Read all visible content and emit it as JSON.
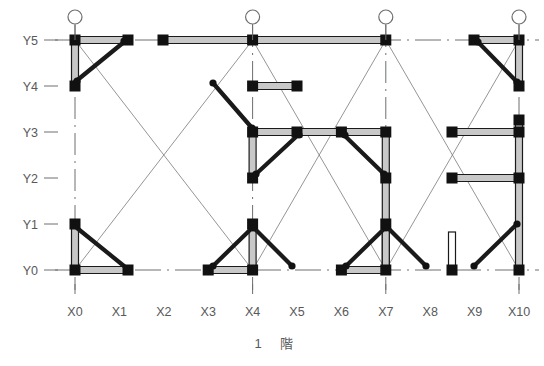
{
  "diagram": {
    "title": "1 階",
    "title_parts": {
      "floor_number": "1",
      "floor_unit": "階"
    },
    "type": "structural-floor-plan",
    "colors": {
      "background": "#ffffff",
      "axis_label": "#58595b",
      "grid_line": "#6d6e71",
      "thin_brace": "#7a7a7a",
      "member": "#1a1a1a",
      "beam_fill": "#c8c8c8",
      "node": "#111111"
    },
    "axes": {
      "x_label_name": "X",
      "y_label_name": "Y",
      "x_labels": [
        "X0",
        "X1",
        "X2",
        "X3",
        "X4",
        "X5",
        "X6",
        "X7",
        "X8",
        "X9",
        "X10"
      ],
      "y_labels": [
        "Y5",
        "Y4",
        "Y3",
        "Y2",
        "Y1",
        "Y0"
      ],
      "x_positions": [
        75,
        119.4,
        163.8,
        208.2,
        252.6,
        297,
        341.4,
        385.8,
        430.2,
        474.6,
        519
      ],
      "y_positions": {
        "Y5": 40,
        "Y4": 86,
        "Y3": 132,
        "Y2": 178,
        "Y1": 224,
        "Y0": 270
      },
      "x_tick_gridlines": [
        "X0",
        "X4",
        "X7",
        "X10"
      ],
      "y_tick_gridlines": [
        "Y5",
        "Y4",
        "Y3",
        "Y2",
        "Y1",
        "Y0"
      ]
    },
    "reference_circles": [
      {
        "name": "grid-circle-x0",
        "x": 75,
        "y": 17,
        "r": 7
      },
      {
        "name": "grid-circle-x4",
        "x": 252.6,
        "y": 17,
        "r": 7
      },
      {
        "name": "grid-circle-x7",
        "x": 385.8,
        "y": 17,
        "r": 7
      },
      {
        "name": "grid-circle-x10",
        "x": 519,
        "y": 17,
        "r": 7
      }
    ],
    "grid_lines_horizontal": [
      {
        "name": "gridline-y5",
        "y": 40,
        "x1": 55,
        "x2": 539,
        "style": "dashed"
      },
      {
        "name": "gridline-y0",
        "y": 270,
        "x1": 55,
        "x2": 539,
        "style": "dashed"
      }
    ],
    "grid_lines_vertical": [
      {
        "name": "gridline-x0",
        "x": 75,
        "y1": 25,
        "y2": 290,
        "style": "dashed"
      },
      {
        "name": "gridline-x4",
        "x": 252.6,
        "y1": 25,
        "y2": 290,
        "style": "dashed"
      },
      {
        "name": "gridline-x7",
        "x": 385.8,
        "y1": 25,
        "y2": 290,
        "style": "dashed"
      },
      {
        "name": "gridline-x10",
        "x": 519,
        "y1": 25,
        "y2": 290,
        "style": "dashed"
      }
    ],
    "thin_braces": [
      {
        "name": "brace-bay1-a",
        "x1": 75,
        "y1": 40,
        "x2": 252.6,
        "y2": 270
      },
      {
        "name": "brace-bay1-b",
        "x1": 252.6,
        "y1": 40,
        "x2": 75,
        "y2": 270
      },
      {
        "name": "brace-bay2-a",
        "x1": 252.6,
        "y1": 40,
        "x2": 385.8,
        "y2": 270
      },
      {
        "name": "brace-bay2-b",
        "x1": 385.8,
        "y1": 40,
        "x2": 252.6,
        "y2": 270
      },
      {
        "name": "brace-bay3-a",
        "x1": 385.8,
        "y1": 40,
        "x2": 519,
        "y2": 270
      },
      {
        "name": "brace-bay3-b",
        "x1": 519,
        "y1": 40,
        "x2": 385.8,
        "y2": 270
      }
    ],
    "beams": [
      {
        "name": "beam-y5-x0-x1",
        "x1": 75,
        "y1": 40,
        "x2": 128,
        "y2": 40
      },
      {
        "name": "beam-y5-x3-x7",
        "x1": 163,
        "y1": 40,
        "x2": 385.8,
        "y2": 40
      },
      {
        "name": "beam-y5-x9-x10",
        "x1": 474,
        "y1": 40,
        "x2": 519,
        "y2": 40
      },
      {
        "name": "beam-x0-y5-y4",
        "x1": 75,
        "y1": 40,
        "x2": 75,
        "y2": 86
      },
      {
        "name": "beam-x10-y5-y4",
        "x1": 519,
        "y1": 40,
        "x2": 519,
        "y2": 86
      },
      {
        "name": "beam-y4-x5-x6",
        "x1": 252.6,
        "y1": 86,
        "x2": 297,
        "y2": 86
      },
      {
        "name": "beam-y3-x4-x7",
        "x1": 252.6,
        "y1": 132,
        "x2": 385.8,
        "y2": 132
      },
      {
        "name": "beam-y3-x9-x10",
        "x1": 452,
        "y1": 132,
        "x2": 519,
        "y2": 132
      },
      {
        "name": "beam-x4-y3-y2",
        "x1": 252.6,
        "y1": 132,
        "x2": 252.6,
        "y2": 178
      },
      {
        "name": "beam-x7-y3-y2",
        "x1": 385.8,
        "y1": 132,
        "x2": 385.8,
        "y2": 178
      },
      {
        "name": "beam-x10-y3-y2",
        "x1": 519,
        "y1": 120,
        "x2": 519,
        "y2": 178
      },
      {
        "name": "beam-y2-x9-x10",
        "x1": 452,
        "y1": 178,
        "x2": 519,
        "y2": 178
      },
      {
        "name": "beam-x7-y2-y0",
        "x1": 385.8,
        "y1": 178,
        "x2": 385.8,
        "y2": 270
      },
      {
        "name": "beam-x10-y2-y0",
        "x1": 519,
        "y1": 178,
        "x2": 519,
        "y2": 270
      },
      {
        "name": "beam-x0-y1-y0",
        "x1": 75,
        "y1": 224,
        "x2": 75,
        "y2": 270
      },
      {
        "name": "beam-x4-y1-y0",
        "x1": 252.6,
        "y1": 224,
        "x2": 252.6,
        "y2": 270
      },
      {
        "name": "beam-x7-y1-y0",
        "x1": 385.8,
        "y1": 224,
        "x2": 385.8,
        "y2": 270
      },
      {
        "name": "beam-y0-x0-x1",
        "x1": 75,
        "y1": 270,
        "x2": 128,
        "y2": 270
      },
      {
        "name": "beam-y0-x3-x4",
        "x1": 208.2,
        "y1": 270,
        "x2": 252.6,
        "y2": 270
      },
      {
        "name": "beam-y0-x6-x7",
        "x1": 341.4,
        "y1": 270,
        "x2": 385.8,
        "y2": 270
      }
    ],
    "diagonal_members": [
      {
        "name": "diag-x0y4-x1y5",
        "x1": 75,
        "y1": 82,
        "x2": 124,
        "y2": 42
      },
      {
        "name": "diag-x5y4-x4y3",
        "x1": 213,
        "y1": 83,
        "x2": 252,
        "y2": 128
      },
      {
        "name": "diag-x5y3-x4y2",
        "x1": 297,
        "y1": 136,
        "x2": 256,
        "y2": 174
      },
      {
        "name": "diag-x6y3-x7y2",
        "x1": 345,
        "y1": 136,
        "x2": 384,
        "y2": 174
      },
      {
        "name": "diag-x9y5-x10y4",
        "x1": 478,
        "y1": 42,
        "x2": 517,
        "y2": 82
      },
      {
        "name": "diag-x9y0-x10y1",
        "x1": 474,
        "y1": 266,
        "x2": 517,
        "y2": 224
      },
      {
        "name": "diag-x0y1-x1y0",
        "x1": 77,
        "y1": 228,
        "x2": 124,
        "y2": 266
      },
      {
        "name": "diag-x3y0-x4y1",
        "x1": 213,
        "y1": 266,
        "x2": 252,
        "y2": 228
      },
      {
        "name": "diag-x4y1-x5y0",
        "x1": 254,
        "y1": 228,
        "x2": 292,
        "y2": 266
      },
      {
        "name": "diag-x6y0-x7y1",
        "x1": 346,
        "y1": 266,
        "x2": 385,
        "y2": 228
      },
      {
        "name": "diag-x7y1-x8y0",
        "x1": 388,
        "y1": 228,
        "x2": 426,
        "y2": 266
      }
    ],
    "square_nodes": [
      {
        "name": "node-x0-y5",
        "x": 75,
        "y": 40
      },
      {
        "name": "node-x1-y5",
        "x": 128,
        "y": 40
      },
      {
        "name": "node-x3-y5",
        "x": 163,
        "y": 40
      },
      {
        "name": "node-x4-y5",
        "x": 252.6,
        "y": 40
      },
      {
        "name": "node-x7-y5",
        "x": 385.8,
        "y": 40
      },
      {
        "name": "node-x9-y5",
        "x": 474,
        "y": 40
      },
      {
        "name": "node-x10-y5",
        "x": 519,
        "y": 40
      },
      {
        "name": "node-x0-y4",
        "x": 75,
        "y": 86
      },
      {
        "name": "node-x5-y4",
        "x": 252.6,
        "y": 86
      },
      {
        "name": "node-x6-y4",
        "x": 297,
        "y": 86
      },
      {
        "name": "node-x10-y4",
        "x": 519,
        "y": 86
      },
      {
        "name": "node-x10-y3b",
        "x": 519,
        "y": 120
      },
      {
        "name": "node-x4-y3",
        "x": 252.6,
        "y": 132
      },
      {
        "name": "node-x5-y3",
        "x": 297,
        "y": 132
      },
      {
        "name": "node-x6-y3",
        "x": 341.4,
        "y": 132
      },
      {
        "name": "node-x7-y3",
        "x": 385.8,
        "y": 132
      },
      {
        "name": "node-x9-y3",
        "x": 452,
        "y": 132
      },
      {
        "name": "node-x10-y3",
        "x": 519,
        "y": 132
      },
      {
        "name": "node-x4-y2",
        "x": 252.6,
        "y": 178
      },
      {
        "name": "node-x7-y2",
        "x": 385.8,
        "y": 178
      },
      {
        "name": "node-x9-y2",
        "x": 452,
        "y": 178
      },
      {
        "name": "node-x10-y2",
        "x": 519,
        "y": 178
      },
      {
        "name": "node-x0-y1",
        "x": 75,
        "y": 224
      },
      {
        "name": "node-x4-y1",
        "x": 252.6,
        "y": 224
      },
      {
        "name": "node-x7-y1",
        "x": 385.8,
        "y": 224
      },
      {
        "name": "node-x0-y0",
        "x": 75,
        "y": 270
      },
      {
        "name": "node-x1-y0",
        "x": 128,
        "y": 270
      },
      {
        "name": "node-x3-y0",
        "x": 208.2,
        "y": 270
      },
      {
        "name": "node-x4-y0",
        "x": 252.6,
        "y": 270
      },
      {
        "name": "node-x6-y0",
        "x": 341.4,
        "y": 270
      },
      {
        "name": "node-x7-y0",
        "x": 385.8,
        "y": 270
      },
      {
        "name": "node-x9-y0",
        "x": 452,
        "y": 270
      },
      {
        "name": "node-x10-y0",
        "x": 519,
        "y": 270
      }
    ],
    "round_nodes": [
      {
        "name": "pin-x1-y5",
        "x": 124,
        "y": 41
      },
      {
        "name": "pin-x0-y4",
        "x": 77,
        "y": 81
      },
      {
        "name": "pin-x5-y4",
        "x": 213,
        "y": 83
      },
      {
        "name": "pin-x4-y3b",
        "x": 252,
        "y": 128
      },
      {
        "name": "pin-x5-y3",
        "x": 299,
        "y": 135
      },
      {
        "name": "pin-x4-y2",
        "x": 256,
        "y": 174
      },
      {
        "name": "pin-x6-y3",
        "x": 345,
        "y": 135
      },
      {
        "name": "pin-x7-y2",
        "x": 384,
        "y": 174
      },
      {
        "name": "pin-x9-y5",
        "x": 478,
        "y": 42
      },
      {
        "name": "pin-x10-y4",
        "x": 517,
        "y": 82
      },
      {
        "name": "pin-x3-y0",
        "x": 213,
        "y": 266
      },
      {
        "name": "pin-x4-y1",
        "x": 253,
        "y": 228
      },
      {
        "name": "pin-x5-y0",
        "x": 292,
        "y": 266
      },
      {
        "name": "pin-x6-y0",
        "x": 346,
        "y": 266
      },
      {
        "name": "pin-x7-y1",
        "x": 386,
        "y": 228
      },
      {
        "name": "pin-x8-y0",
        "x": 426,
        "y": 266
      },
      {
        "name": "pin-x9-y0",
        "x": 474,
        "y": 266
      },
      {
        "name": "pin-x10-y1",
        "x": 517,
        "y": 224
      }
    ],
    "wall_elements": [
      {
        "name": "wall-x9-vertical",
        "x": 452,
        "y_top": 232,
        "y_bottom": 268,
        "width": 7
      }
    ]
  }
}
